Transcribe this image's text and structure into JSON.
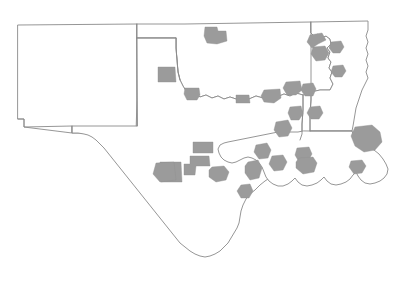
{
  "map": {
    "title": "South Central United States county highlight map",
    "type": "choropleth-outline",
    "background_color": "#ffffff",
    "outline_color": "#8a8a8a",
    "highlight_fill_color": "#9b9b9b",
    "outline_width_px": 0.9,
    "width_px": 410,
    "height_px": 281,
    "legend": null,
    "labels": [],
    "states": [
      {
        "name": "new-mexico",
        "label": "",
        "outline": "M 18,25 L 137,24 L 137,100 L 136,133 L 72,133 L 72,126 L 24,127 L 24,119 L 18,119 Z"
      },
      {
        "name": "oklahoma-panhandle-and-oklahoma",
        "label": "",
        "outline": "M 137,24 L 185,24 L 311,22 L 311,33 L 314,36 L 318,34 L 321,38 L 326,36 L 330,39 L 331,44 L 327,48 L 330,52 L 328,58 L 331,62 L 329,68 L 332,72 L 330,78 L 333,84 L 330,90 L 320,90 L 311,92 L 303,95 L 296,93 L 290,96 L 284,94 L 277,97 L 270,95 L 263,98 L 256,96 L 249,99 L 243,97 L 236,99 L 230,97 L 224,99 L 218,96 L 212,98 L 206,95 L 200,97 L 195,93 L 190,95 L 186,91 L 183,86 L 180,80 L 178,72 L 177,60 L 176,48 L 176,38 L 161,38 L 148,38 L 137,38 Z"
      },
      {
        "name": "texas",
        "label": "",
        "outline": "M 137,38 L 176,38 L 176,48 L 177,60 L 178,72 L 180,80 L 183,86 L 186,91 L 190,95 L 195,93 L 200,97 L 206,95 L 212,98 L 218,96 L 224,99 L 230,97 L 236,99 L 243,97 L 249,99 L 256,96 L 263,98 L 270,95 L 277,97 L 284,94 L 290,96 L 296,93 L 303,95 L 303,110 L 302,124 L 302,134 L 300,140 L 296,145 L 292,151 L 289,158 L 285,163 L 281,168 L 276,173 L 271,177 L 265,181 L 260,185 L 255,190 L 250,194 L 246,199 L 243,205 L 241,211 L 240,217 L 239,223 L 237,228 L 234,233 L 231,238 L 228,243 L 224,247 L 220,251 L 215,254 L 210,256 L 205,257 L 200,256 L 195,254 L 190,251 L 185,247 L 180,243 L 176,238 L 172,233 L 168,228 L 164,223 L 160,218 L 156,213 L 152,208 L 148,203 L 144,198 L 140,193 L 136,188 L 132,183 L 128,178 L 124,173 L 120,168 L 116,163 L 112,158 L 108,153 L 104,148 L 100,144 L 96,140 L 92,137 L 88,135 L 84,134 L 78,133 L 72,133 L 72,126 L 137,126 Z"
      },
      {
        "name": "arkansas",
        "label": "",
        "outline": "M 311,22 L 368,21 L 368,30 L 366,36 L 368,42 L 366,48 L 368,54 L 366,60 L 368,66 L 366,72 L 368,78 L 365,84 L 362,90 L 360,96 L 358,102 L 356,108 L 355,114 L 354,120 L 353,126 L 352,131 L 310,131 L 310,115 L 311,100 L 311,92 L 320,90 L 330,90 L 333,84 L 330,78 L 332,72 L 329,68 L 331,62 L 328,58 L 330,52 L 327,48 L 331,44 L 330,39 L 326,36 L 321,38 L 318,34 L 314,36 L 311,33 Z"
      },
      {
        "name": "louisiana",
        "label": "",
        "outline": "M 310,131 L 352,131 L 354,137 L 357,142 L 362,145 L 368,147 L 374,150 L 379,154 L 383,159 L 386,164 L 388,169 L 387,174 L 384,178 L 380,181 L 375,183 L 370,184 L 365,183 L 361,180 L 358,176 L 356,172 L 353,175 L 350,179 L 346,182 L 341,184 L 336,185 L 331,184 L 327,181 L 324,177 L 321,180 L 317,183 L 312,185 L 307,186 L 302,185 L 298,182 L 295,178 L 292,181 L 288,184 L 283,186 L 278,186 L 273,184 L 269,181 L 266,177 L 264,172 L 262,167 L 259,163 L 256,160 L 252,158 L 248,157 L 244,158 L 240,160 L 236,162 L 232,163 L 228,162 L 224,160 L 221,157 L 219,153 L 218,149 L 220,145 L 224,143 L 228,142 L 233,141 L 238,140 L 243,139 L 248,138 L 253,137 L 258,136 L 263,135 L 268,134 L 273,133 L 278,132 L 283,132 L 288,132 L 293,132 L 298,132 L 303,131 Z"
      }
    ],
    "internal_borders": [
      {
        "name": "nm-tx-border",
        "path": "M 137,24 L 137,126"
      },
      {
        "name": "ok-panhandle-south",
        "path": "M 137,38 L 176,38"
      },
      {
        "name": "ok-panhandle-east",
        "path": "M 176,38 L 176,48 L 177,60 L 178,72 L 180,80"
      },
      {
        "name": "nm-south-step",
        "path": "M 72,126 L 72,133 L 24,127 L 24,119 L 18,119"
      },
      {
        "name": "ok-ar-border",
        "path": "M 311,22 L 311,33 L 311,92 L 311,100 L 310,115 L 310,131"
      },
      {
        "name": "ar-la-border",
        "path": "M 310,131 L 352,131"
      },
      {
        "name": "tx-la-border",
        "path": "M 303,95 L 303,110 L 302,124 L 302,134 L 300,140"
      }
    ],
    "highlights": [
      {
        "name": "highlight-oklahoma-northwest",
        "path": "M 205,27 L 217,27 L 218,31 L 226,31 L 227,41 L 217,44 L 207,43 L 204,36 Z"
      },
      {
        "name": "highlight-texas-panhandle-amarillo",
        "path": "M 158,67 L 175,67 L 176,82 L 158,82 Z"
      },
      {
        "name": "highlight-texas-lubbock",
        "path": "M 185,88 L 199,88 L 200,95 L 197,100 L 187,100 L 184,94 Z"
      },
      {
        "name": "highlight-texas-wichita-falls",
        "path": "M 236,95 L 249,95 L 250,103 L 236,103 Z"
      },
      {
        "name": "highlight-texas-dallas-fort-worth",
        "path": "M 264,90 L 280,89 L 281,98 L 274,103 L 264,102 L 261,96 Z"
      },
      {
        "name": "highlight-texas-midland-odessa",
        "path": "M 160,162 L 181,162 L 182,182 L 161,182 Z"
      },
      {
        "name": "highlight-texas-san-angelo",
        "path": "M 190,156 L 209,156 L 210,166 L 196,166 L 195,175 L 184,175 L 184,164 L 190,164 Z"
      },
      {
        "name": "highlight-texas-abilene",
        "path": "M 193,142 L 213,142 L 213,153 L 193,153 Z"
      },
      {
        "name": "highlight-texas-waco",
        "path": "M 212,167 L 224,166 L 229,172 L 226,180 L 216,182 L 209,177 L 209,170 Z"
      },
      {
        "name": "highlight-texas-austin",
        "path": "M 248,162 L 258,160 L 262,168 L 259,178 L 250,180 L 245,173 L 245,166 Z"
      },
      {
        "name": "highlight-texas-college-station",
        "path": "M 256,145 L 267,143 L 271,150 L 268,158 L 259,159 L 254,152 Z"
      },
      {
        "name": "highlight-texas-tyler",
        "path": "M 276,122 L 288,120 L 292,128 L 288,136 L 279,137 L 274,130 Z"
      },
      {
        "name": "highlight-texas-longview",
        "path": "M 290,107 L 301,106 L 303,114 L 299,120 L 291,120 L 288,113 Z"
      },
      {
        "name": "highlight-texas-texarkana",
        "path": "M 286,82 L 300,81 L 302,90 L 296,95 L 287,95 L 283,88 Z"
      },
      {
        "name": "highlight-texas-beaumont",
        "path": "M 297,148 L 309,147 L 312,154 L 308,161 L 299,162 L 295,155 Z"
      },
      {
        "name": "highlight-texas-houston-area",
        "path": "M 272,156 L 283,155 L 287,162 L 283,170 L 274,171 L 269,164 Z"
      },
      {
        "name": "highlight-texas-corpus-christi",
        "path": "M 241,185 L 250,184 L 253,191 L 249,198 L 241,198 L 237,191 Z"
      },
      {
        "name": "highlight-texas-el-paso",
        "path": "M 156,163 L 174,162 L 176,180 L 160,182 L 153,174 Z"
      },
      {
        "name": "highlight-arkansas-northeast",
        "path": "M 310,35 L 322,33 L 326,40 L 318,44 L 312,48 L 307,42 Z"
      },
      {
        "name": "highlight-arkansas-northwest",
        "path": "M 313,47 L 325,46 L 329,53 L 325,60 L 316,61 L 311,54 Z"
      },
      {
        "name": "highlight-arkansas-little-rock",
        "path": "M 331,42 L 341,41 L 344,47 L 340,53 L 333,53 L 329,48 Z"
      },
      {
        "name": "highlight-arkansas-central",
        "path": "M 333,66 L 343,65 L 346,71 L 342,77 L 335,77 L 331,72 Z"
      },
      {
        "name": "highlight-arkansas-southwest",
        "path": "M 303,84 L 313,83 L 316,89 L 313,96 L 305,96 L 301,90 Z"
      },
      {
        "name": "highlight-louisiana-shreveport",
        "path": "M 310,107 L 320,106 L 323,113 L 319,119 L 311,119 L 307,113 Z"
      },
      {
        "name": "highlight-louisiana-baton-rouge",
        "path": "M 299,158 L 313,157 L 317,163 L 314,172 L 303,174 L 296,168 L 296,162 Z"
      },
      {
        "name": "highlight-louisiana-new-orleans",
        "path": "M 355,127 L 372,125 L 380,132 L 382,142 L 375,150 L 364,152 L 355,146 L 351,136 Z"
      },
      {
        "name": "highlight-mississippi-river-band",
        "path": "M 351,161 L 362,160 L 366,166 L 362,173 L 354,174 L 349,167 Z"
      }
    ]
  }
}
